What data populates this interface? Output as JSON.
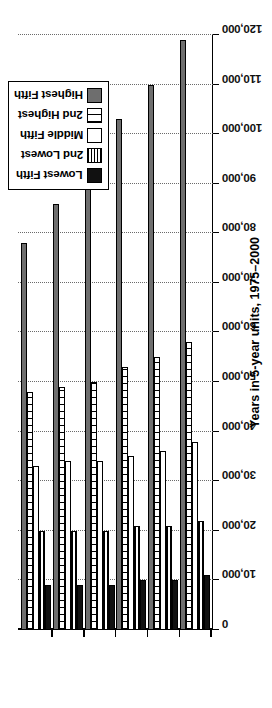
{
  "chart_data": {
    "type": "bar",
    "orientation": "horizontal",
    "title": "",
    "xlabel": "Years in 5-year units, 1975–2000",
    "ylabel": "Income in U.S. Dollars",
    "categories": [
      "1975",
      "1980",
      "1985",
      "1990",
      "1995",
      "2000"
    ],
    "value_axis": {
      "min": 0,
      "max": 120000,
      "step": 10000,
      "ticks": [
        0,
        10000,
        20000,
        30000,
        40000,
        50000,
        60000,
        70000,
        80000,
        90000,
        100000,
        110000,
        120000
      ],
      "tick_labels": [
        "0",
        "10,000",
        "20,000",
        "30,000",
        "40,000",
        "50,000",
        "60,000",
        "70,000",
        "80,000",
        "90,000",
        "100,000",
        "110,000",
        "120,000"
      ],
      "grid": true
    },
    "legend_position": "top-left",
    "series": [
      {
        "name": "Highest Fifth",
        "pattern": "solid-dark-gray",
        "color": "#6e6e6e",
        "values": [
          78000,
          86000,
          92000,
          103000,
          110000,
          119000
        ]
      },
      {
        "name": "2nd Highest",
        "pattern": "vertical-lines",
        "color": "#ffffff",
        "values": [
          48000,
          49000,
          50000,
          53000,
          55000,
          58000
        ]
      },
      {
        "name": "Middle Fifth",
        "pattern": "white",
        "color": "#ffffff",
        "values": [
          33000,
          34000,
          34000,
          35000,
          36000,
          38000
        ]
      },
      {
        "name": "2nd Lowest",
        "pattern": "horizontal-lines",
        "color": "#ffffff",
        "values": [
          20000,
          20000,
          20000,
          21000,
          21000,
          22000
        ]
      },
      {
        "name": "Lowest Fifth",
        "pattern": "solid-black",
        "color": "#111111",
        "values": [
          9000,
          9000,
          9000,
          10000,
          10000,
          11000
        ]
      }
    ]
  },
  "legend": {
    "items": [
      {
        "label": "Highest Fifth",
        "swatch": "swatch-highest-fifth"
      },
      {
        "label": "2nd Highest",
        "swatch": "swatch-2nd-highest"
      },
      {
        "label": "Middle Fifth",
        "swatch": "swatch-middle-fifth"
      },
      {
        "label": "2nd Lowest",
        "swatch": "swatch-2nd-lowest"
      },
      {
        "label": "Lowest Fifth",
        "swatch": "swatch-lowest-fifth"
      }
    ]
  },
  "axes": {
    "y_title": "Income in U.S. Dollars",
    "x_title": "Years in 5-year units, 1975–2000"
  },
  "colors": {
    "highest": "#6e6e6e",
    "lowest": "#111111",
    "axis": "#000000",
    "grid": "#6b6b6b",
    "background": "#ffffff"
  }
}
